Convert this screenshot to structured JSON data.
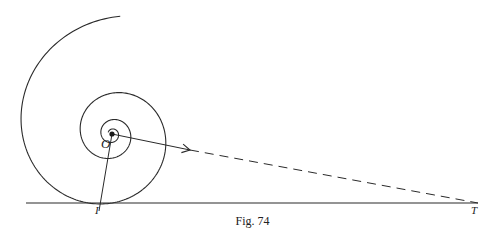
{
  "figure": {
    "caption": "Fig. 74",
    "labels": {
      "center": "O",
      "tangent_point": "I",
      "tangent_end": "T"
    },
    "colors": {
      "ink": "#2a2a2a",
      "background": "#ffffff"
    },
    "spiral": {
      "type": "logarithmic",
      "center": [
        112,
        134
      ],
      "start_angle_deg": -86,
      "start_radius": 118,
      "turns": 3.2,
      "radius_ratio_per_turn": 0.35
    },
    "tangent_line": {
      "from": [
        26,
        203
      ],
      "to": [
        478,
        203
      ]
    },
    "radius_vector": {
      "from": [
        112,
        134
      ],
      "to": [
        99,
        211
      ]
    },
    "direction_arrow": {
      "from": [
        112,
        134
      ],
      "to": [
        190,
        150
      ]
    },
    "dashed_line": {
      "from": [
        190,
        150
      ],
      "to": [
        478,
        203
      ]
    }
  }
}
